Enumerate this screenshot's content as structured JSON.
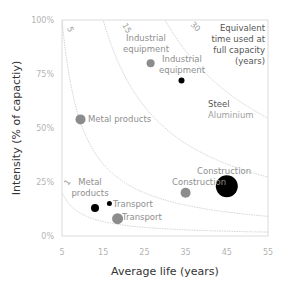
{
  "chart_data": {
    "type": "scatter",
    "title": "",
    "xlabel": "Average life (years)",
    "ylabel": "Intensity (% of capactiy)",
    "xlim": [
      5,
      55
    ],
    "ylim": [
      0,
      100
    ],
    "x_ticks": [
      "5",
      "15",
      "25",
      "35",
      "45",
      "55"
    ],
    "y_ticks": [
      "0%",
      "25%",
      "50%",
      "75%",
      "100%"
    ],
    "grid": false,
    "legend": {
      "title": [
        "Equivalent",
        "time used at",
        "full capacity",
        "(years)"
      ],
      "entries": [
        {
          "name": "Steel",
          "color": "#000000"
        },
        {
          "name": "Aluminium",
          "color": "#8c8c8c"
        }
      ],
      "position": "top-right"
    },
    "iso_curves": [
      {
        "label": "1",
        "equivalent_years": 1
      },
      {
        "label": "5",
        "equivalent_years": 5
      },
      {
        "label": "15",
        "equivalent_years": 15
      },
      {
        "label": "30",
        "equivalent_years": 30
      }
    ],
    "series": [
      {
        "name": "Steel",
        "color": "#000000",
        "points": [
          {
            "label": "Industrial equipment",
            "x": 34,
            "y": 72,
            "size": 3
          },
          {
            "label": "Construction",
            "x": 45,
            "y": 23,
            "size": 11
          },
          {
            "label": "Metal products",
            "x": 13,
            "y": 13,
            "size": 4
          },
          {
            "label": "Transport",
            "x": 16.5,
            "y": 15,
            "size": 2.5
          }
        ]
      },
      {
        "name": "Aluminium",
        "color": "#8c8c8c",
        "points": [
          {
            "label": "Industrial equipment",
            "x": 26.5,
            "y": 80,
            "size": 4
          },
          {
            "label": "Metal products",
            "x": 9.5,
            "y": 54,
            "size": 5
          },
          {
            "label": "Construction",
            "x": 35,
            "y": 20,
            "size": 5
          },
          {
            "label": "Transport",
            "x": 18.5,
            "y": 8,
            "size": 5.5
          }
        ]
      }
    ]
  }
}
